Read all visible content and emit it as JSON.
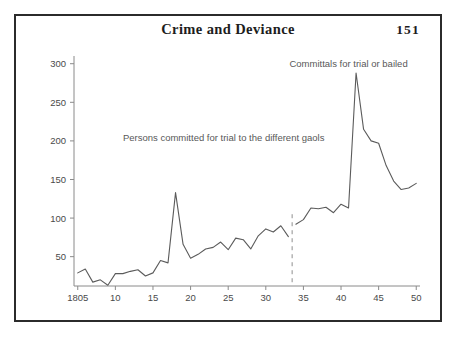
{
  "header": {
    "title": "Crime and Deviance",
    "page_number": "151"
  },
  "annotations": {
    "series1_label": "Persons committed for trial to the different gaols",
    "series2_label": "Committals for trial or bailed"
  },
  "axis": {
    "y_ticks": [
      "50",
      "100",
      "150",
      "200",
      "250",
      "300"
    ],
    "x_ticks": [
      "1805",
      "10",
      "15",
      "20",
      "25",
      "30",
      "35",
      "40",
      "45",
      "50"
    ]
  },
  "colors": {
    "frame": "#2b2b2b",
    "axis": "#8a8a8a",
    "line": "#5b5b5b",
    "break": "#8e8e8e",
    "text": "#4a4a4a",
    "title": "#1d1d1d",
    "background": "#ffffff"
  },
  "chart_data": {
    "type": "line",
    "title": "Crime and Deviance",
    "xlabel": "",
    "ylabel": "",
    "xlim": [
      1804.5,
      1850.5
    ],
    "ylim": [
      12,
      310
    ],
    "grid": false,
    "legend": "none",
    "annotations": [
      {
        "text": "Persons committed for trial to the different gaols",
        "x": 1811,
        "y": 200,
        "series": "Persons committed for trial to the different gaols"
      },
      {
        "text": "Committals for trial or bailed",
        "x": 1841,
        "y": 296,
        "series": "Committals for trial or bailed"
      }
    ],
    "vertical_break": {
      "x": 1833.5,
      "style": "dashed",
      "note": "series definition change"
    },
    "series": [
      {
        "name": "Persons committed for trial to the different gaols",
        "x": [
          1805,
          1806,
          1807,
          1808,
          1809,
          1810,
          1811,
          1812,
          1813,
          1814,
          1815,
          1816,
          1817,
          1818,
          1819,
          1820,
          1821,
          1822,
          1823,
          1824,
          1825,
          1826,
          1827,
          1828,
          1829,
          1830,
          1831,
          1832,
          1833
        ],
        "values": [
          29,
          34,
          17,
          20,
          13,
          28,
          28,
          31,
          33,
          25,
          29,
          45,
          42,
          133,
          66,
          48,
          53,
          60,
          62,
          69,
          59,
          74,
          72,
          60,
          77,
          86,
          82,
          90,
          76
        ]
      },
      {
        "name": "Committals for trial or bailed",
        "x": [
          1834,
          1835,
          1836,
          1837,
          1838,
          1839,
          1840,
          1841,
          1842,
          1843,
          1844,
          1845,
          1846,
          1847,
          1848,
          1849,
          1850
        ],
        "values": [
          92,
          98,
          113,
          112,
          114,
          107,
          118,
          113,
          288,
          215,
          200,
          197,
          168,
          148,
          137,
          139,
          145
        ]
      }
    ]
  }
}
